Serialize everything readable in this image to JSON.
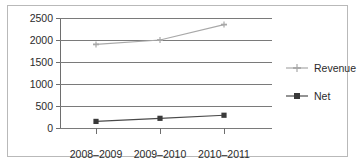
{
  "chart_data": {
    "type": "line",
    "title": "",
    "xlabel": "",
    "ylabel": "",
    "categories": [
      "2008–2009",
      "2009–2010",
      "2010–2011"
    ],
    "series": [
      {
        "name": "Revenue",
        "values": [
          1900,
          2000,
          2350
        ],
        "color": "#a8a8a8",
        "marker": "cross"
      },
      {
        "name": "Net",
        "values": [
          150,
          220,
          290
        ],
        "color": "#4a4a4a",
        "marker": "square"
      }
    ],
    "ylim": [
      0,
      2500
    ],
    "yticks": [
      0,
      500,
      1000,
      1500,
      2000,
      2500
    ],
    "ytick_labels": [
      "0",
      "500",
      "1000",
      "1500",
      "2000",
      "2500"
    ],
    "grid": true,
    "legend_position": "right"
  },
  "legend": {
    "items": [
      {
        "label": "Revenue"
      },
      {
        "label": "Net"
      }
    ]
  }
}
